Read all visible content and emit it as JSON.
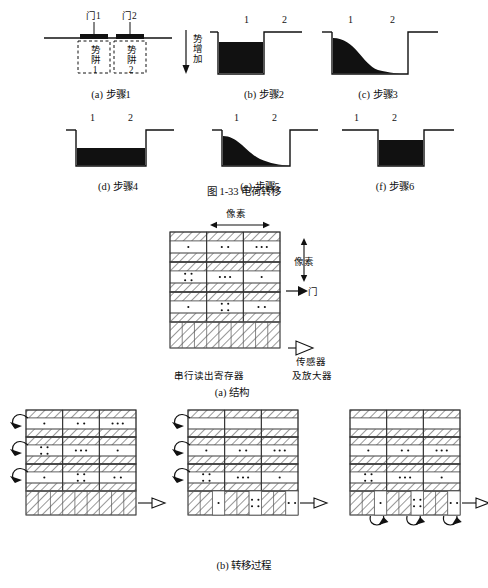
{
  "figure1": {
    "caption": "图 1-33  电荷转移",
    "panels": [
      {
        "id": "a",
        "label": "(a) 步骤1",
        "gate_labels": [
          "门1",
          "门2"
        ],
        "well_labels": [
          "势阱1",
          "势阱2"
        ],
        "numbers": []
      },
      {
        "id": "b",
        "label": "(b) 步骤2",
        "numbers": [
          "1",
          "2"
        ],
        "axis_label": "势增加"
      },
      {
        "id": "c",
        "label": "(c) 步骤3",
        "numbers": [
          "1",
          "2"
        ]
      },
      {
        "id": "d",
        "label": "(d) 步骤4",
        "numbers": [
          "1",
          "2"
        ]
      },
      {
        "id": "e",
        "label": "(e) 步骤5",
        "numbers": [
          "1",
          "2"
        ]
      },
      {
        "id": "f",
        "label": "(f) 步骤6",
        "numbers": [
          "1",
          "2"
        ]
      }
    ]
  },
  "figure2": {
    "structure": {
      "caption": "(a) 结构",
      "top_label": "像素",
      "side_label": "像素",
      "gate_label": "门",
      "register_label": "串行读出寄存器",
      "amplifier_label": "传感器\n及放大器",
      "amplifier_line1": "传感器",
      "amplifier_line2": "及放大器",
      "charge_rows": [
        [
          1,
          2,
          3
        ],
        [
          4,
          3,
          1
        ],
        [
          1,
          4,
          2
        ]
      ]
    },
    "transfer": {
      "caption": "(b) 转移过程",
      "panels": [
        {
          "id": "left",
          "arrows": "side",
          "charge_rows": [
            [
              1,
              2,
              3
            ],
            [
              4,
              3,
              1
            ],
            [
              1,
              4,
              2
            ]
          ],
          "register_charges": [
            0,
            0,
            0
          ]
        },
        {
          "id": "middle",
          "arrows": "side",
          "charge_rows": [
            [
              0,
              0,
              0
            ],
            [
              1,
              2,
              3
            ],
            [
              4,
              3,
              1
            ]
          ],
          "register_charges": [
            1,
            4,
            2
          ]
        },
        {
          "id": "right",
          "arrows": "bottom",
          "charge_rows": [
            [
              0,
              0,
              0
            ],
            [
              1,
              2,
              3
            ],
            [
              4,
              3,
              1
            ]
          ],
          "register_charges": [
            1,
            4,
            2
          ]
        }
      ]
    }
  }
}
